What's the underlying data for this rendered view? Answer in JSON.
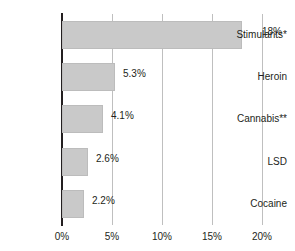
{
  "chart_data": {
    "type": "bar",
    "orientation": "horizontal",
    "title": "",
    "xlabel": "",
    "ylabel": "",
    "categories": [
      "Stimulants*",
      "Heroin",
      "Cannabis**",
      "LSD",
      "Cocaine"
    ],
    "values": [
      18,
      5.3,
      4.1,
      2.6,
      2.2
    ],
    "value_labels": [
      "18%",
      "5.3%",
      "4.1%",
      "2.6%",
      "2.2%"
    ],
    "xlim": [
      0,
      20
    ],
    "xticks": [
      0,
      5,
      10,
      15,
      20
    ],
    "xtick_labels": [
      "0%",
      "5%",
      "10%",
      "15%",
      "20%"
    ],
    "grid": true,
    "legend": false,
    "series": [
      {
        "name": "",
        "values": [
          18,
          5.3,
          4.1,
          2.6,
          2.2
        ]
      }
    ],
    "colors": {
      "bar_fill": "#c9c9c9",
      "bar_stroke": "#bcbcbc",
      "axis": "#231f20",
      "grid": "#bfbfbf",
      "text": "#231f20",
      "background": "#ffffff"
    }
  }
}
